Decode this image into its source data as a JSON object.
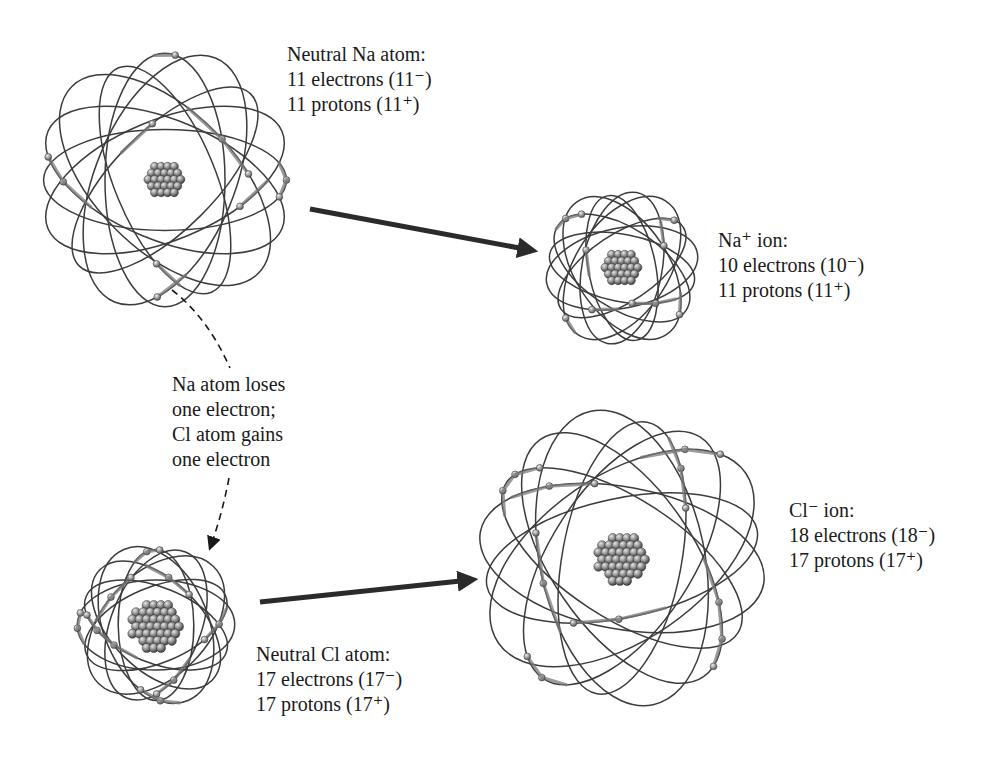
{
  "diagram": {
    "type": "ion-formation",
    "colors": {
      "orbit": "#3c3c3c",
      "electron": "#8a8a8a",
      "nucleus": "#6e6e6e",
      "arrow": "#2b2b2b",
      "text": "#1a1a1a"
    },
    "atoms": [
      {
        "id": "na-atom",
        "cx": 165,
        "cy": 180,
        "rx": 132,
        "ry": 120,
        "nucleus_r": 20,
        "orbits": 8,
        "electrons": 11,
        "label": {
          "x": 287,
          "y": 42,
          "title": "Neutral Na atom:",
          "electrons_line": "11 electrons (11⁻)",
          "protons_line": "11 protons (11⁺)"
        }
      },
      {
        "id": "na-ion",
        "cx": 622,
        "cy": 268,
        "rx": 80,
        "ry": 80,
        "nucleus_r": 20,
        "orbits": 8,
        "electrons": 10,
        "label": {
          "x": 718,
          "y": 228,
          "title": "Na⁺ ion:",
          "electrons_line": "10 electrons (10⁻)",
          "protons_line": "11 protons (11⁺)"
        }
      },
      {
        "id": "cl-atom",
        "cx": 156,
        "cy": 625,
        "rx": 82,
        "ry": 90,
        "nucleus_r": 27,
        "orbits": 8,
        "electrons": 17,
        "label": {
          "x": 256,
          "y": 642,
          "title": "Neutral Cl atom:",
          "electrons_line": "17 electrons (17⁻)",
          "protons_line": "17 protons (17⁺)"
        }
      },
      {
        "id": "cl-ion",
        "cx": 622,
        "cy": 558,
        "rx": 150,
        "ry": 142,
        "nucleus_r": 27,
        "orbits": 8,
        "electrons": 18,
        "label": {
          "x": 789,
          "y": 498,
          "title": "Cl⁻ ion:",
          "electrons_line": "18 electrons (18⁻)",
          "protons_line": "17 protons (17⁺)"
        }
      }
    ],
    "arrows": [
      {
        "id": "na-to-na-ion",
        "x1": 310,
        "y1": 209,
        "x2": 530,
        "y2": 250
      },
      {
        "id": "cl-to-cl-ion",
        "x1": 260,
        "y1": 602,
        "x2": 470,
        "y2": 580
      }
    ],
    "transfer_note": {
      "x": 172,
      "y": 372,
      "lines": [
        "Na atom loses",
        "one electron;",
        "Cl atom gains",
        "one electron"
      ]
    }
  }
}
